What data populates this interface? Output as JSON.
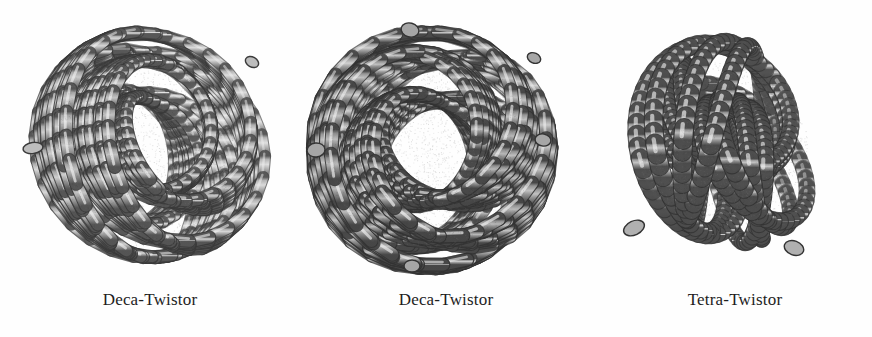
{
  "page": {
    "background_color": "#fefefe",
    "width": 872,
    "height": 337,
    "kind": "figure-plate"
  },
  "figures": [
    {
      "id": "figure-1",
      "caption": "Deca-Twistor",
      "subject": "woven tubular knot ball",
      "symmetry": "5-fold",
      "tone": "light",
      "center_x": 150,
      "center_y": 146,
      "radius": 120,
      "strand_count": 10,
      "tube_color_light": "#e9e9e9",
      "tube_color_mid": "#bdbdbd",
      "tube_color_dark": "#595959",
      "outline_color": "#3a3a3a"
    },
    {
      "id": "figure-2",
      "caption": "Deca-Twistor",
      "subject": "woven tubular knot ball",
      "symmetry": "5-fold",
      "tone": "dark",
      "center_x": 430,
      "center_y": 150,
      "radius": 122,
      "strand_count": 10,
      "tube_color_light": "#dcdcdc",
      "tube_color_mid": "#a6a6a6",
      "tube_color_dark": "#4a4a4a",
      "outline_color": "#333333"
    },
    {
      "id": "figure-3",
      "caption": "Tetra-Twistor",
      "subject": "woven tubular knot ball",
      "symmetry": "4-fold",
      "tone": "medium",
      "center_x": 722,
      "center_y": 144,
      "radius": 100,
      "strand_count": 4,
      "tube_color_light": "#e2e2e2",
      "tube_color_mid": "#b0b0b0",
      "tube_color_dark": "#505050",
      "outline_color": "#333333"
    }
  ]
}
